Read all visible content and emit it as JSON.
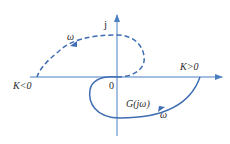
{
  "diagram": {
    "type": "nyquist-plot",
    "axes": {
      "imag_label": "j",
      "origin_label": "0"
    },
    "labels": {
      "k_negative": "K<0",
      "k_positive": "K>0",
      "transfer_function": "G(jω)",
      "omega_upper": "ω",
      "omega_lower": "ω"
    },
    "curves": [
      {
        "name": "G(jω) for K>0",
        "style": "solid",
        "quadrant": "lower half-plane, from K>0 point back to origin"
      },
      {
        "name": "mirror curve for K<0",
        "style": "dashed",
        "quadrant": "upper half-plane, from origin out to K<0 point"
      }
    ],
    "colors": {
      "axis": "#4a7fc0",
      "curve": "#3f6db3",
      "text": "#2a2a2a",
      "background": "#ffffff"
    }
  }
}
